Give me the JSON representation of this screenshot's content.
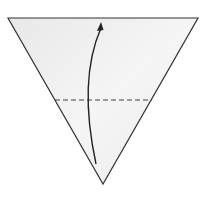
{
  "diagram": {
    "type": "origami-fold-step",
    "colors": {
      "background": "#ffffff",
      "paper_fill": "#ececec",
      "paper_fill_light": "#f6f6f6",
      "outline": "#333333",
      "fold_line": "#444444",
      "arrow": "#222222"
    },
    "paper": {
      "shape": "inverted-triangle",
      "points": [
        [
          8,
          18
        ],
        [
          198,
          18
        ],
        [
          103,
          184
        ]
      ]
    },
    "fold_line": {
      "style": "valley-dashed",
      "from": [
        55,
        100
      ],
      "to": [
        152,
        100
      ]
    },
    "fold_arrow": {
      "direction": "up",
      "start": [
        96,
        164
      ],
      "control": [
        78,
        80
      ],
      "end": [
        101,
        22
      ]
    }
  }
}
